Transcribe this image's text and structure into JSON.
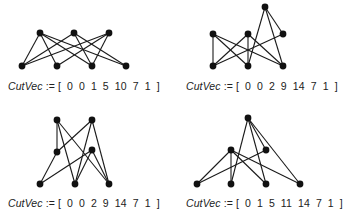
{
  "colors": {
    "stroke": "#1a1a1a",
    "node": "#111111",
    "text": "#222222",
    "background": "#ffffff"
  },
  "panels": [
    {
      "caption": {
        "var": "CutVec",
        "op": ":=",
        "vector": "[ 0  0  1  5  10  7  1 ]"
      },
      "nodes": [
        [
          40,
          33
        ],
        [
          74,
          33
        ],
        [
          109,
          33
        ],
        [
          22,
          66
        ],
        [
          57,
          66
        ],
        [
          92,
          66
        ],
        [
          126,
          66
        ]
      ],
      "edges": [
        [
          0,
          3
        ],
        [
          0,
          4
        ],
        [
          0,
          5
        ],
        [
          0,
          6
        ],
        [
          1,
          3
        ],
        [
          1,
          5
        ],
        [
          1,
          6
        ],
        [
          2,
          3
        ],
        [
          2,
          4
        ],
        [
          2,
          5
        ]
      ]
    },
    {
      "caption": {
        "var": "CutVec",
        "op": ":=",
        "vector": "[ 0  0  2  9  14  7  1 ]"
      },
      "nodes": [
        [
          213,
          34
        ],
        [
          248,
          34
        ],
        [
          283,
          34
        ],
        [
          265,
          7
        ],
        [
          213,
          66
        ],
        [
          248,
          66
        ],
        [
          283,
          66
        ]
      ],
      "edges": [
        [
          0,
          4
        ],
        [
          0,
          5
        ],
        [
          0,
          6
        ],
        [
          1,
          4
        ],
        [
          1,
          5
        ],
        [
          1,
          6
        ],
        [
          2,
          4
        ],
        [
          3,
          5
        ],
        [
          3,
          6
        ],
        [
          3,
          2
        ]
      ]
    },
    {
      "caption": {
        "var": "CutVec",
        "op": ":=",
        "vector": "[ 0  0  2  9  14  7  1 ]"
      },
      "nodes": [
        [
          57,
          120
        ],
        [
          92,
          120
        ],
        [
          57,
          152
        ],
        [
          92,
          150
        ],
        [
          40,
          184
        ],
        [
          75,
          184
        ],
        [
          109,
          184
        ]
      ],
      "edges": [
        [
          0,
          2
        ],
        [
          0,
          5
        ],
        [
          0,
          6
        ],
        [
          1,
          2
        ],
        [
          1,
          5
        ],
        [
          1,
          6
        ],
        [
          2,
          4
        ],
        [
          3,
          4
        ],
        [
          3,
          5
        ],
        [
          3,
          6
        ]
      ]
    },
    {
      "caption": {
        "var": "CutVec",
        "op": ":=",
        "vector": "[ 0  1  5  11  14  7  1 ]"
      },
      "nodes": [
        [
          248,
          118
        ],
        [
          231,
          150
        ],
        [
          266,
          150
        ],
        [
          197,
          184
        ],
        [
          231,
          184
        ],
        [
          266,
          184
        ],
        [
          300,
          184
        ]
      ],
      "edges": [
        [
          0,
          4
        ],
        [
          0,
          5
        ],
        [
          0,
          6
        ],
        [
          0,
          2
        ],
        [
          1,
          3
        ],
        [
          1,
          4
        ],
        [
          1,
          5
        ],
        [
          1,
          6
        ],
        [
          2,
          3
        ]
      ]
    }
  ],
  "caption_positions": [
    [
      8,
      80
    ],
    [
      186,
      80
    ],
    [
      8,
      197
    ],
    [
      186,
      197
    ]
  ]
}
